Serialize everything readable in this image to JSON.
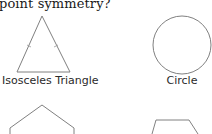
{
  "question": {
    "text": "point symmetry?"
  },
  "shapes": [
    {
      "name": "Isosceles Triangle",
      "label": "Isosceles Triangle",
      "fully_visible": true
    },
    {
      "name": "Circle",
      "label": "Circle",
      "fully_visible": true
    },
    {
      "name": "Pentagon",
      "label": "",
      "fully_visible": false
    },
    {
      "name": "Trapezoid",
      "label": "",
      "fully_visible": false
    }
  ],
  "colors": {
    "stroke": "#808080",
    "text": "#1a1a1a",
    "background": "#ffffff"
  }
}
